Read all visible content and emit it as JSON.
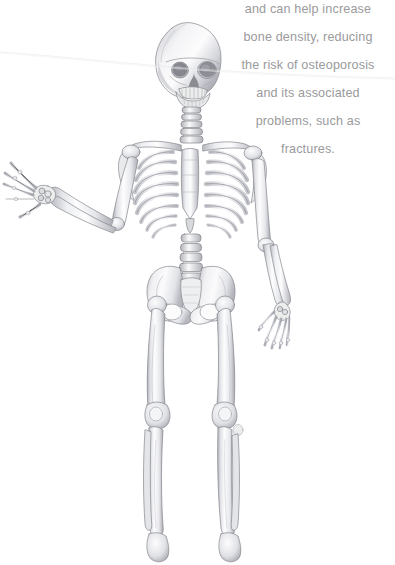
{
  "page": {
    "background_color": "#ffffff",
    "width": 395,
    "height": 565
  },
  "caption": {
    "text_color": "#9a9a9c",
    "alignment": "center",
    "clipped_line_above": "may reduce the risk of heart disease",
    "lines": [
      "and can help increase",
      "bone density, reducing",
      "the risk of osteoporosis",
      "and its associated",
      "problems, such as",
      "fractures."
    ]
  },
  "illustration": {
    "title": "Human skeleton, anterior view",
    "medium": "graphite pencil rendering",
    "crop_note": "figure is cropped at the ankles by the bottom page edge",
    "palette": {
      "bone_light": "#fbfbfc",
      "bone_mid": "#dcdde1",
      "bone_shadow": "#b9bac0",
      "bone_deep": "#8f9097",
      "outline": "#6f7077"
    },
    "parts": [
      {
        "name": "skull",
        "label": "Skull (cranium and mandible)"
      },
      {
        "name": "cervical-spine",
        "label": "Cervical vertebrae"
      },
      {
        "name": "clavicle-left",
        "label": "Left clavicle"
      },
      {
        "name": "clavicle-right",
        "label": "Right clavicle"
      },
      {
        "name": "scapula-left",
        "label": "Left scapula"
      },
      {
        "name": "scapula-right",
        "label": "Right scapula"
      },
      {
        "name": "ribcage",
        "label": "Thoracic cage (ribs)"
      },
      {
        "name": "sternum",
        "label": "Sternum"
      },
      {
        "name": "lumbar-spine",
        "label": "Lumbar vertebrae"
      },
      {
        "name": "humerus-left",
        "label": "Left humerus"
      },
      {
        "name": "humerus-right",
        "label": "Right humerus"
      },
      {
        "name": "radius-ulna-left",
        "label": "Left radius and ulna"
      },
      {
        "name": "radius-ulna-right",
        "label": "Right radius and ulna"
      },
      {
        "name": "hand-left",
        "label": "Left hand, fingers splayed"
      },
      {
        "name": "hand-right",
        "label": "Right hand, hanging"
      },
      {
        "name": "pelvis",
        "label": "Pelvis and sacrum"
      },
      {
        "name": "femur-left",
        "label": "Left femur"
      },
      {
        "name": "femur-right",
        "label": "Right femur"
      },
      {
        "name": "patella-left",
        "label": "Left patella"
      },
      {
        "name": "patella-right",
        "label": "Right patella"
      },
      {
        "name": "tibia-fibula-left",
        "label": "Left tibia and fibula"
      },
      {
        "name": "tibia-fibula-right",
        "label": "Right tibia and fibula"
      }
    ]
  }
}
